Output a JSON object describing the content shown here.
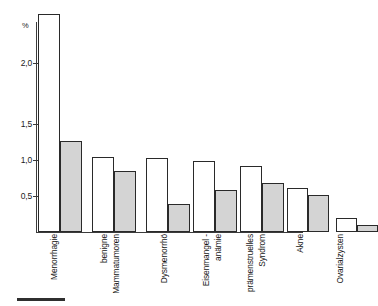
{
  "chart_data": {
    "type": "bar",
    "title": "",
    "subtitle": "",
    "xlabel": "",
    "ylabel": "%",
    "unit": "%",
    "ylim": [
      0,
      2.5
    ],
    "grid": false,
    "legend_position": "none",
    "yticks": [
      0.5,
      1.0,
      1.5,
      2.0
    ],
    "ytick_labels": [
      "0,5",
      "1,0",
      "1,5",
      "2,0"
    ],
    "categories": [
      "Menorrhagie",
      "benigne Mammatumoren",
      "Dysmenorrhö",
      "Eisenmangel-anämie",
      "prämenstruelles Syndrom",
      "Akne",
      "Ovarialzysten"
    ],
    "series": [
      {
        "name": "weiss",
        "fill": "#ffffff",
        "values": [
          2.4,
          1.04,
          1.03,
          0.98,
          0.92,
          0.61,
          0.19
        ]
      },
      {
        "name": "grau",
        "fill": "#d4d4d4",
        "values": [
          1.26,
          0.85,
          0.39,
          0.58,
          0.68,
          0.51,
          0.1
        ]
      }
    ],
    "bars_in_plot_order": [
      {
        "category": "Menorrhagie",
        "series": "weiss",
        "value": 2.4
      },
      {
        "category": "Menorrhagie",
        "series": "grau",
        "value": 1.26
      },
      {
        "category": "benigne Mammatumoren",
        "series": "weiss",
        "value": 1.04
      },
      {
        "category": "benigne Mammatumoren",
        "series": "grau",
        "value": 0.85
      },
      {
        "category": "Dysmenorrhö",
        "series": "weiss",
        "value": 1.03
      },
      {
        "category": "Dysmenorrhö",
        "series": "grau",
        "value": 0.39
      },
      {
        "category": "Eisenmangel-anämie",
        "series": "weiss",
        "value": 0.98
      },
      {
        "category": "Eisenmangel-anämie",
        "series": "grau",
        "value": 0.58
      },
      {
        "category": "prämenstruelles Syndrom",
        "series": "weiss",
        "value": 0.92
      },
      {
        "category": "prämenstruelles Syndrom",
        "series": "grau",
        "value": 0.68
      },
      {
        "category": "Akne",
        "series": "weiss",
        "value": 0.61
      },
      {
        "category": "Akne",
        "series": "grau",
        "value": 0.51
      },
      {
        "category": "Ovarialzysten",
        "series": "weiss",
        "value": 0.19
      },
      {
        "category": "Ovarialzysten",
        "series": "grau",
        "value": 0.1
      }
    ]
  },
  "axis": {
    "unit_label": "%",
    "tick_2_0": "2,0",
    "tick_1_5": "1,5",
    "tick_1_0": "1,0",
    "tick_0_5": "0,5"
  },
  "categories_display": {
    "c0_line1": "Menorrhagie",
    "c1_line1": "benigne",
    "c1_line2": "Mammatumoren",
    "c2_line1": "Dysmenorrhö",
    "c3_line1": "Eisenmangel -",
    "c3_line2": "anämie",
    "c4_line1": "prämenstruelles",
    "c4_line2": "Syndrom",
    "c5_line1": "Akne",
    "c6_line1": "Ovarialzysten"
  },
  "colors": {
    "bar_white": "#ffffff",
    "bar_gray": "#d4d4d4",
    "outline": "#2a2a2a",
    "axis": "#3b3b3b",
    "text": "#161616",
    "background": "#ffffff"
  }
}
